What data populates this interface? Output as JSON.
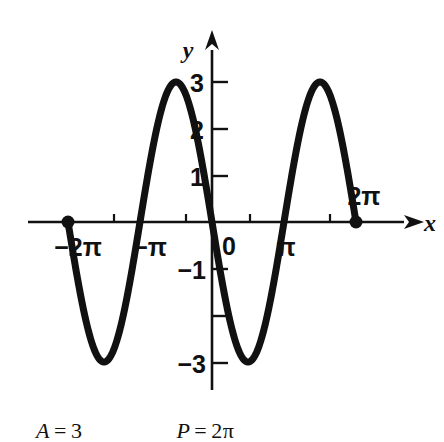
{
  "figure": {
    "background_color": "#ffffff",
    "ink_color": "#111111",
    "axes": {
      "x_axis_label": "x",
      "y_axis_label": "y",
      "origin_label": "0"
    },
    "x_ticks": [
      {
        "label": "−2π",
        "value": -6.2832,
        "has_point": true
      },
      {
        "label": "",
        "value": -4.7124,
        "has_point": false
      },
      {
        "label": "−π",
        "value": -3.1416,
        "has_point": false
      },
      {
        "label": "",
        "value": -1.5708,
        "has_point": false
      },
      {
        "label": "0",
        "value": 0,
        "has_point": false
      },
      {
        "label": "",
        "value": 1.5708,
        "has_point": false
      },
      {
        "label": "π",
        "value": 3.1416,
        "has_point": false
      },
      {
        "label": "",
        "value": 4.7124,
        "has_point": false
      },
      {
        "label": "2π",
        "value": 6.2832,
        "has_point": true
      }
    ],
    "y_ticks": [
      {
        "label": "3",
        "value": 3
      },
      {
        "label": "2",
        "value": 2
      },
      {
        "label": "1",
        "value": 1
      },
      {
        "label": "−1",
        "value": -1
      },
      {
        "label": "",
        "value": -2
      },
      {
        "label": "−3",
        "value": -3
      }
    ]
  },
  "chart_data": {
    "type": "line",
    "title": "",
    "xlabel": "x",
    "ylabel": "y",
    "xlim": [
      -7.6,
      8.4
    ],
    "ylim": [
      -3.6,
      3.6
    ],
    "grid": false,
    "legend": "none",
    "function": "y = -3 sin(x)",
    "amplitude": 3,
    "period": 6.2832,
    "xtick_labels": [
      "−2π",
      "−π",
      "0",
      "π",
      "2π"
    ],
    "xtick_values": [
      -6.2832,
      -3.1416,
      0,
      3.1416,
      6.2832
    ],
    "ytick_labels": [
      "3",
      "2",
      "1",
      "−1",
      "−3"
    ],
    "ytick_values": [
      3,
      2,
      1,
      -1,
      -3
    ],
    "annotations": [
      {
        "text": "endpoint",
        "x": -6.2832,
        "y": 0,
        "marker": "filled-circle"
      },
      {
        "text": "endpoint",
        "x": 6.2832,
        "y": 0,
        "marker": "filled-circle"
      }
    ],
    "key_points": [
      {
        "x": -6.2832,
        "y": 0
      },
      {
        "x": -4.7124,
        "y": 3
      },
      {
        "x": -3.1416,
        "y": 0
      },
      {
        "x": -1.5708,
        "y": -3
      },
      {
        "x": 0,
        "y": 0
      },
      {
        "x": 1.5708,
        "y": 3
      },
      {
        "x": 3.1416,
        "y": 0
      },
      {
        "x": 4.7124,
        "y": -3
      },
      {
        "x": 6.2832,
        "y": 0
      }
    ]
  },
  "caption": {
    "amplitude_var": "A",
    "amplitude_eq": "=",
    "amplitude_value": "3",
    "period_var": "P",
    "period_eq": "=",
    "period_value": "2π"
  }
}
